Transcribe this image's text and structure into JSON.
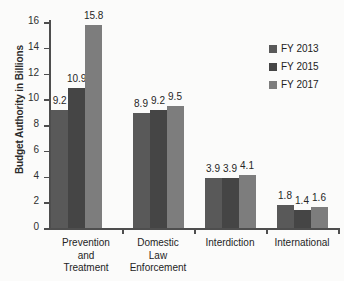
{
  "chart_data": {
    "type": "bar",
    "title": "",
    "xlabel": "",
    "ylabel": "Budget Authority in Billions",
    "ylim": [
      0,
      16
    ],
    "y_ticks": [
      0,
      2,
      4,
      6,
      8,
      10,
      12,
      14,
      16
    ],
    "y_tick_labels": [
      "0",
      "2",
      "4",
      "6",
      "8",
      "10",
      "12",
      "14",
      "16"
    ],
    "grid": false,
    "legend_position": "top-right",
    "categories": [
      "Prevention and Treatment",
      "Domestic Law Enforcement",
      "Interdiction",
      "International"
    ],
    "category_label_lines": [
      [
        "Prevention",
        "and",
        "Treatment"
      ],
      [
        "Domestic",
        "Law",
        "Enforcement"
      ],
      [
        "Interdiction"
      ],
      [
        "International"
      ]
    ],
    "series": [
      {
        "name": "FY 2013",
        "color": "#595959",
        "values": [
          9.2,
          8.9,
          3.9,
          1.8
        ],
        "value_labels": [
          "9.2",
          "8.9",
          "3.9",
          "1.8"
        ]
      },
      {
        "name": "FY 2015",
        "color": "#454545",
        "values": [
          10.9,
          9.2,
          3.9,
          1.4
        ],
        "value_labels": [
          "10.9",
          "9.2",
          "3.9",
          "1.4"
        ]
      },
      {
        "name": "FY 2017",
        "color": "#7d7d7d",
        "values": [
          15.8,
          9.5,
          4.1,
          1.6
        ],
        "value_labels": [
          "15.8",
          "9.5",
          "4.1",
          "1.6"
        ]
      }
    ]
  }
}
